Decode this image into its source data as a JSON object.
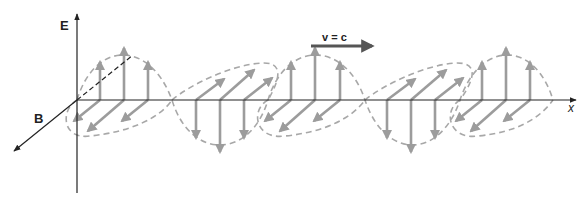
{
  "diagram": {
    "labels": {
      "e_axis": "E",
      "b_axis": "B",
      "x_axis": "x",
      "velocity": "v = c"
    },
    "colors": {
      "axis": "#222222",
      "field_arrow": "#9c9c9c",
      "envelope": "#a8a8a8",
      "velocity_arrow": "#555555",
      "background": "#ffffff"
    },
    "geometry": {
      "origin": [
        77,
        100
      ],
      "x_axis_end": 576,
      "e_axis_top": 14,
      "e_axis_bottom": 193,
      "b_axis_end": [
        14,
        151
      ],
      "half_period_starts": [
        77,
        172,
        268,
        365,
        460
      ],
      "half_period_end": 553,
      "amplitude": 52
    }
  }
}
